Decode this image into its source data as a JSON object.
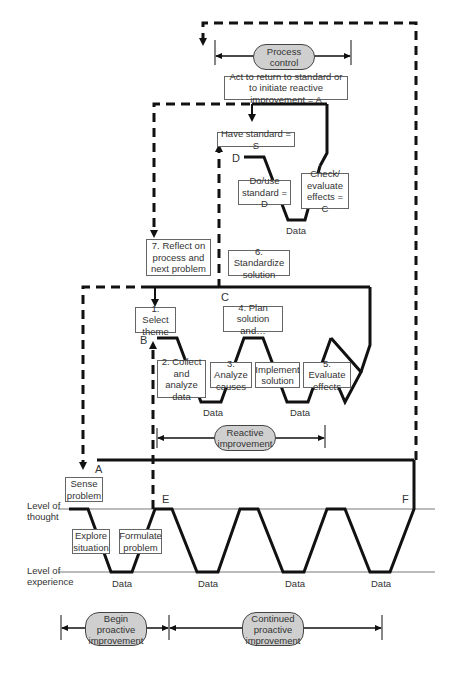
{
  "process_control": {
    "pill": "Process control",
    "act_box": "Act to return to standard or to initiate reactive improvement = A",
    "have_standard": "Have standard = S",
    "do_use": "Do/use standard = D",
    "check": "Check/ evaluate effects = C",
    "data": "Data"
  },
  "reactive": {
    "step7": "7. Reflect on process and next problem",
    "step6": "6. Standardize solution",
    "step1": "1. Select theme",
    "step4": "4. Plan solution and…",
    "step2": "2. Collect and analyze data",
    "step3": "3. Analyze causes",
    "implement": "Implement solution",
    "step5": "5. Evaluate effects",
    "data1": "Data",
    "data2": "Data",
    "pill": "Reactive improvement"
  },
  "proactive": {
    "sense": "Sense problem",
    "explore": "Explore situation",
    "formulate": "Formulate problem",
    "data": [
      "Data",
      "Data",
      "Data",
      "Data"
    ],
    "begin_pill": "Begin proactive improvement",
    "continued_pill": "Continued proactive improvement"
  },
  "levels": {
    "thought": "Level of thought",
    "experience": "Level of experience"
  },
  "letters": {
    "A": "A",
    "B": "B",
    "C": "C",
    "D": "D",
    "E": "E",
    "F": "F"
  }
}
